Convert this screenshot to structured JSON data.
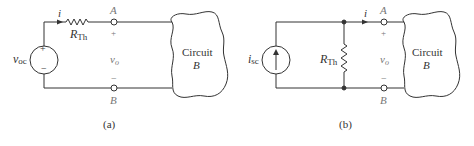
{
  "figure_a": {
    "caption": "(a)",
    "source_label": "v",
    "source_sub": "oc",
    "source_plus": "+",
    "source_minus": "−",
    "current_label": "i",
    "resistor_label": "R",
    "resistor_sub": "Th",
    "terminal_top": "A",
    "terminal_bottom": "B",
    "plus": "+",
    "minus": "−",
    "voltage_label": "v",
    "voltage_sub": "o",
    "circuit_label_1": "Circuit",
    "circuit_label_2": "B"
  },
  "figure_b": {
    "caption": "(b)",
    "source_label": "i",
    "source_sub": "sc",
    "current_label": "i",
    "resistor_label": "R",
    "resistor_sub": "Th",
    "terminal_top": "A",
    "terminal_bottom": "B",
    "plus": "+",
    "minus": "−",
    "voltage_label": "v",
    "voltage_sub": "o",
    "circuit_label_1": "Circuit",
    "circuit_label_2": "B"
  },
  "colors": {
    "wire": "#333333",
    "text": "#333333",
    "muted": "#777777"
  }
}
